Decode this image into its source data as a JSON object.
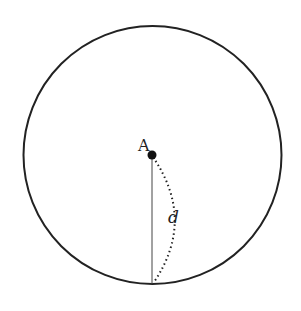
{
  "diagram": {
    "circle": {
      "cx": 152.5,
      "cy": 155,
      "r": 129,
      "stroke": "#222222"
    },
    "point": {
      "label": "A",
      "x": 152,
      "y": 155,
      "color": "#111111"
    },
    "radius_line": {
      "x1": 152,
      "y1": 155,
      "x2": 152,
      "y2": 284
    },
    "arc_label": "d"
  }
}
